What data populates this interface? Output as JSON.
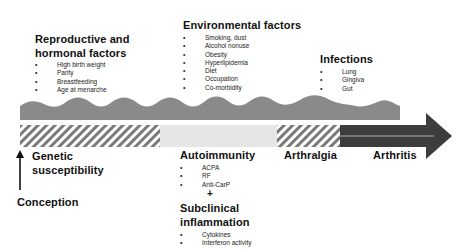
{
  "top_factors": {
    "reproductive": {
      "heading_line1": "Reproductive and",
      "heading_line2": "hormonal factors",
      "items": [
        "High birth weight",
        "Parity",
        "Breastfeeding",
        "Age at menarche"
      ]
    },
    "environmental": {
      "heading": "Environmental factors",
      "items": [
        "Smoking, dust",
        "Alcohol nonuse",
        "Obesity",
        "Hyperlipidemia",
        "Diet",
        "Occupation",
        "Co-morbidity"
      ]
    },
    "infections": {
      "heading": "Infections",
      "items": [
        "Lung",
        "Gingiva",
        "Gut"
      ]
    }
  },
  "timeline_stages": {
    "genetic": {
      "line1": "Genetic",
      "line2": "susceptibility"
    },
    "conception": "Conception",
    "autoimmunity": {
      "heading": "Autoimmunity",
      "items": [
        "ACPA",
        "RF",
        "Anti-CarP"
      ]
    },
    "plus": "+",
    "subclinical": {
      "line1": "Subclinical",
      "line2": "inflammation",
      "items": [
        "Cytokines",
        "Interferon activity"
      ]
    },
    "arthralgia": "Arthralgia",
    "arthritis": "Arthritis"
  },
  "colors": {
    "wave": "#8a8a8a",
    "hatch_dark": "#7a7a7a",
    "hatch_light": "#ffffff",
    "light_segment": "#e6e6e6",
    "dark_segment": "#3d3d3d",
    "text": "#111111"
  }
}
